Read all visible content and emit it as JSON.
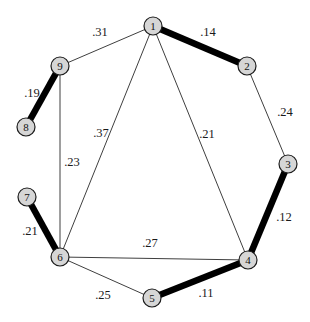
{
  "diagram": {
    "type": "weighted-graph",
    "background_color": "#ffffff",
    "node_fill_color": "#d6d6d6",
    "node_stroke_color": "#1c1c1c",
    "thin_edge_color": "#3f3f3f",
    "thick_edge_color": "#000000",
    "node_radius": 9,
    "thin_edge_width": 1,
    "thick_edge_width": 6.5,
    "nodes": [
      {
        "id": "1",
        "x": 153,
        "y": 26
      },
      {
        "id": "2",
        "x": 247,
        "y": 66
      },
      {
        "id": "3",
        "x": 288,
        "y": 164
      },
      {
        "id": "4",
        "x": 248,
        "y": 260
      },
      {
        "id": "5",
        "x": 152,
        "y": 298
      },
      {
        "id": "6",
        "x": 60,
        "y": 257
      },
      {
        "id": "7",
        "x": 27,
        "y": 197
      },
      {
        "id": "8",
        "x": 26,
        "y": 127
      },
      {
        "id": "9",
        "x": 60,
        "y": 66
      }
    ],
    "edges": [
      {
        "from": "9",
        "to": "1",
        "weight": ".31",
        "thick": false,
        "label_x": 100,
        "label_y": 36
      },
      {
        "from": "1",
        "to": "2",
        "weight": ".14",
        "thick": true,
        "label_x": 208,
        "label_y": 36
      },
      {
        "from": "8",
        "to": "9",
        "weight": ".19",
        "thick": true,
        "label_x": 32,
        "label_y": 97
      },
      {
        "from": "2",
        "to": "3",
        "weight": ".24",
        "thick": false,
        "label_x": 285,
        "label_y": 116
      },
      {
        "from": "1",
        "to": "6",
        "weight": ".37",
        "thick": false,
        "label_x": 101,
        "label_y": 137
      },
      {
        "from": "1",
        "to": "4",
        "weight": ".21",
        "thick": false,
        "label_x": 207,
        "label_y": 138
      },
      {
        "from": "9",
        "to": "6",
        "weight": ".23",
        "thick": false,
        "label_x": 72,
        "label_y": 166
      },
      {
        "from": "3",
        "to": "4",
        "weight": ".12",
        "thick": true,
        "label_x": 284,
        "label_y": 221
      },
      {
        "from": "7",
        "to": "6",
        "weight": ".21",
        "thick": true,
        "label_x": 30,
        "label_y": 235
      },
      {
        "from": "6",
        "to": "4",
        "weight": ".27",
        "thick": false,
        "label_x": 150,
        "label_y": 247
      },
      {
        "from": "6",
        "to": "5",
        "weight": ".25",
        "thick": false,
        "label_x": 103,
        "label_y": 299
      },
      {
        "from": "5",
        "to": "4",
        "weight": ".11",
        "thick": true,
        "label_x": 206,
        "label_y": 297
      }
    ]
  }
}
